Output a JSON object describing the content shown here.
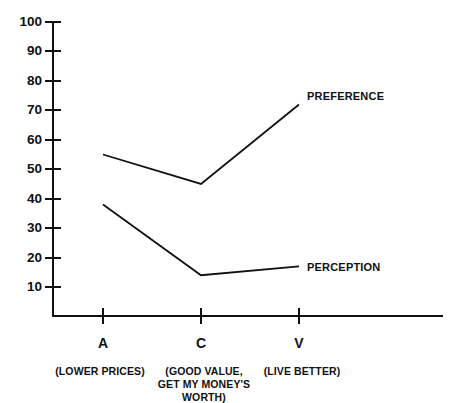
{
  "chart_data": {
    "type": "line",
    "title": "",
    "subtitle": "",
    "xlabel": "",
    "ylabel": "",
    "grid": false,
    "legend_position": "inline-right-of-line-end",
    "ylim": [
      0,
      100
    ],
    "y_ticks": [
      100,
      90,
      80,
      70,
      60,
      50,
      40,
      30,
      20,
      10
    ],
    "categories": [
      "A",
      "C",
      "V"
    ],
    "category_descriptions": [
      [
        "(LOWER PRICES)"
      ],
      [
        "(GOOD VALUE,",
        "GET MY MONEY'S",
        "WORTH)"
      ],
      [
        "(LIVE BETTER)"
      ]
    ],
    "series": [
      {
        "name": "PREFERENCE",
        "values": [
          55,
          45,
          72
        ]
      },
      {
        "name": "PERCEPTION",
        "values": [
          38,
          14,
          17
        ]
      }
    ],
    "colors": {
      "line": "#111111",
      "axis": "#111111",
      "background": "#ffffff"
    }
  },
  "axis": {
    "y_tick_labels": {
      "t100": "100",
      "t90": "90",
      "t80": "80",
      "t70": "70",
      "t60": "60",
      "t50": "50",
      "t40": "40",
      "t30": "30",
      "t20": "20",
      "t10": "10"
    },
    "x_categories": {
      "c0": "A",
      "c1": "C",
      "c2": "V"
    },
    "x_descriptions": {
      "a_line1": "(LOWER PRICES)",
      "c_line1": "(GOOD VALUE,",
      "c_line2": "GET MY MONEY'S",
      "c_line3": "WORTH)",
      "v_line1": "(LIVE BETTER)"
    }
  },
  "series_labels": {
    "preference": "PREFERENCE",
    "perception": "PERCEPTION"
  }
}
